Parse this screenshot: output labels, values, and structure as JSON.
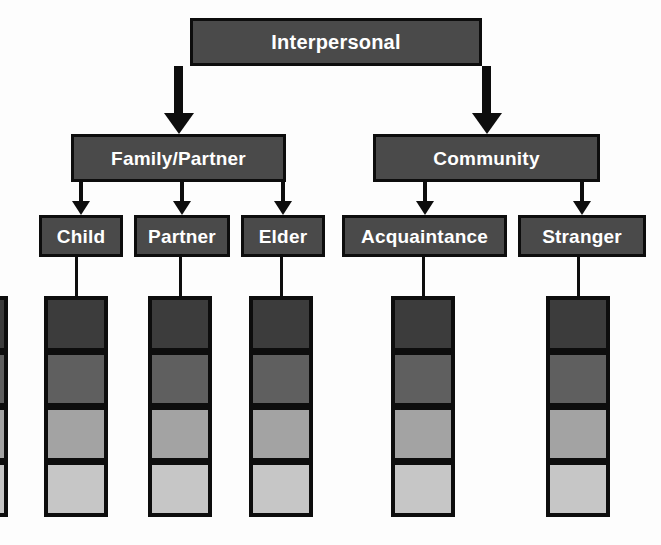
{
  "diagram": {
    "title": "Interpersonal",
    "type": "hierarchy-tree-with-gradient-scales",
    "background_color": "#fdfdfd",
    "node_fill_color": "#4a4a4a",
    "node_border_color": "#0d0d0d",
    "node_text_color": "#ffffff",
    "levels": [
      {
        "level": 1,
        "nodes": [
          {
            "id": "interpersonal",
            "label": "Interpersonal",
            "x": 190,
            "y": 18,
            "w": 292,
            "h": 48
          }
        ]
      },
      {
        "level": 2,
        "nodes": [
          {
            "id": "family-partner",
            "label": "Family/Partner",
            "x": 71,
            "y": 134,
            "w": 215,
            "h": 48
          },
          {
            "id": "community",
            "label": "Community",
            "x": 373,
            "y": 134,
            "w": 227,
            "h": 48
          }
        ]
      },
      {
        "level": 3,
        "nodes": [
          {
            "id": "child",
            "label": "Child",
            "x": 39,
            "y": 215,
            "w": 84,
            "h": 42
          },
          {
            "id": "partner",
            "label": "Partner",
            "x": 134,
            "y": 215,
            "w": 96,
            "h": 42
          },
          {
            "id": "elder",
            "label": "Elder",
            "x": 241,
            "y": 215,
            "w": 84,
            "h": 42
          },
          {
            "id": "acquaintance",
            "label": "Acquaintance",
            "x": 342,
            "y": 215,
            "w": 165,
            "h": 42
          },
          {
            "id": "stranger",
            "label": "Stranger",
            "x": 518,
            "y": 215,
            "w": 128,
            "h": 42
          }
        ]
      }
    ],
    "connectors": [
      {
        "id": "interpersonal-to-family-partner",
        "from": "interpersonal",
        "to": "family-partner",
        "style": "thick-arrow"
      },
      {
        "id": "interpersonal-to-community",
        "from": "interpersonal",
        "to": "community",
        "style": "thick-arrow"
      },
      {
        "id": "family-partner-to-child",
        "from": "family-partner",
        "to": "child",
        "style": "thin-arrow"
      },
      {
        "id": "family-partner-to-partner",
        "from": "family-partner",
        "to": "partner",
        "style": "thin-arrow"
      },
      {
        "id": "family-partner-to-elder",
        "from": "family-partner",
        "to": "elder",
        "style": "thin-arrow"
      },
      {
        "id": "community-to-acquaintance",
        "from": "community",
        "to": "acquaintance",
        "style": "thin-arrow"
      },
      {
        "id": "community-to-stranger",
        "from": "community",
        "to": "stranger",
        "style": "thin-arrow"
      },
      {
        "id": "child-to-scale",
        "from": "child",
        "to": "scale-child",
        "style": "plain-line"
      },
      {
        "id": "partner-to-scale",
        "from": "partner",
        "to": "scale-partner",
        "style": "plain-line"
      },
      {
        "id": "elder-to-scale",
        "from": "elder",
        "to": "scale-elder",
        "style": "plain-line"
      },
      {
        "id": "acquaintance-to-scale",
        "from": "acquaintance",
        "to": "scale-acquaintance",
        "style": "plain-line"
      },
      {
        "id": "stranger-to-scale",
        "from": "stranger",
        "to": "scale-stranger",
        "style": "plain-line"
      }
    ],
    "gradient_scale": {
      "description": "Four-step shading scale beneath each leaf node, darkest at top to lightest at bottom",
      "steps": 4,
      "step_colors": [
        "#3c3c3c",
        "#5f5f5f",
        "#a3a3a3",
        "#c6c6c6"
      ],
      "border_color": "#0d0d0d",
      "box_width": 64,
      "box_height": 56,
      "row_tops": [
        296,
        351,
        406,
        461
      ],
      "columns": [
        {
          "id": "scale-cut-off",
          "node": null,
          "x": -56,
          "clipped": true
        },
        {
          "id": "scale-child",
          "node": "child",
          "x": 44,
          "clipped": false
        },
        {
          "id": "scale-partner",
          "node": "partner",
          "x": 148,
          "clipped": false
        },
        {
          "id": "scale-elder",
          "node": "elder",
          "x": 249,
          "clipped": false
        },
        {
          "id": "scale-acquaintance",
          "node": "acquaintance",
          "x": 391,
          "clipped": false
        },
        {
          "id": "scale-stranger",
          "node": "stranger",
          "x": 546,
          "clipped": false
        }
      ]
    }
  }
}
